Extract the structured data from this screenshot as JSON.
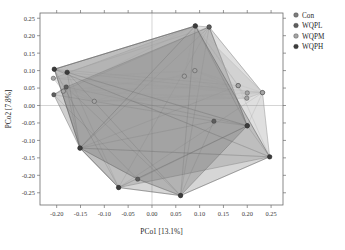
{
  "figure": {
    "type": "pcoa-scatter-plot",
    "background": "#ffffff"
  },
  "axes": {
    "x": {
      "label": "PCo1 [13.1%]",
      "ticks": [
        "-0.20",
        "-0.15",
        "-0.10",
        "-0.05",
        "0.00",
        "0.05",
        "0.10",
        "0.15",
        "0.20",
        "0.25"
      ],
      "tick_values": [
        -0.2,
        -0.15,
        -0.1,
        -0.05,
        0.0,
        0.05,
        0.1,
        0.15,
        0.2,
        0.25
      ],
      "range": [
        -0.235,
        0.275
      ]
    },
    "y": {
      "label": "PCo2 [7.8%]",
      "ticks": [
        "0.25",
        "0.20",
        "0.15",
        "0.10",
        "0.05",
        "0.00",
        "-0.05",
        "-0.10",
        "-0.15",
        "-0.20",
        "-0.25"
      ],
      "tick_values": [
        0.25,
        0.2,
        0.15,
        0.1,
        0.05,
        0.0,
        -0.05,
        -0.1,
        -0.15,
        -0.2,
        -0.25
      ],
      "range": [
        -0.285,
        0.265
      ]
    }
  },
  "legend": {
    "position": "right",
    "items": [
      {
        "label": "Con",
        "color": "#7d7d7d",
        "marker": "circle"
      },
      {
        "label": "WQPL",
        "color": "#5e5e5e",
        "marker": "circle"
      },
      {
        "label": "WQPM",
        "color": "#a5a5a5",
        "marker": "circle"
      },
      {
        "label": "WQPH",
        "color": "#3c3c3c",
        "marker": "circle"
      }
    ]
  },
  "chart_data": {
    "type": "scatter",
    "title": "",
    "xlabel": "PCo1 [13.1%]",
    "ylabel": "PCo2 [7.8%]",
    "xlim": [
      -0.235,
      0.275
    ],
    "ylim": [
      -0.285,
      0.265
    ],
    "grid": false,
    "zero_lines": true,
    "legend_position": "right",
    "series": [
      {
        "name": "Con",
        "color": "#7d7d7d",
        "fill": "rgba(150,150,150,0.30)",
        "stroke": "#8a8a8a",
        "points": [
          [
            -0.205,
            0.104
          ],
          [
            -0.178,
            0.095
          ],
          [
            -0.151,
            -0.122
          ],
          [
            -0.07,
            -0.235
          ],
          [
            0.091,
            0.228
          ],
          [
            0.12,
            0.225
          ],
          [
            0.181,
            0.057
          ],
          [
            0.232,
            0.037
          ],
          [
            0.247,
            -0.147
          ],
          [
            0.2,
            -0.058
          ]
        ]
      },
      {
        "name": "WQPL",
        "color": "#5e5e5e",
        "fill": "rgba(110,110,110,0.32)",
        "stroke": "#6e6e6e",
        "points": [
          [
            -0.206,
            0.031
          ],
          [
            -0.18,
            0.053
          ],
          [
            -0.151,
            -0.122
          ],
          [
            -0.03,
            -0.211
          ],
          [
            0.06,
            -0.258
          ],
          [
            0.13,
            -0.045
          ],
          [
            0.2,
            -0.058
          ],
          [
            0.12,
            0.225
          ]
        ]
      },
      {
        "name": "WQPM",
        "color": "#a5a5a5",
        "fill": "rgba(185,185,185,0.34)",
        "stroke": "#b0b0b0",
        "points": [
          [
            -0.207,
            0.078
          ],
          [
            -0.186,
            0.041
          ],
          [
            -0.121,
            0.012
          ],
          [
            0.068,
            0.084
          ],
          [
            0.09,
            0.1
          ],
          [
            0.181,
            0.057
          ],
          [
            0.2,
            0.036
          ],
          [
            0.199,
            0.021
          ],
          [
            0.232,
            0.037
          ],
          [
            0.091,
            0.228
          ]
        ]
      },
      {
        "name": "WQPH",
        "color": "#3c3c3c",
        "fill": "rgba(95,95,95,0.26)",
        "stroke": "#5a5a5a",
        "points": [
          [
            -0.205,
            0.104
          ],
          [
            -0.178,
            0.095
          ],
          [
            -0.151,
            -0.122
          ],
          [
            -0.07,
            -0.235
          ],
          [
            0.06,
            -0.258
          ],
          [
            0.247,
            -0.147
          ],
          [
            0.2,
            -0.058
          ],
          [
            0.091,
            0.228
          ]
        ]
      }
    ]
  }
}
